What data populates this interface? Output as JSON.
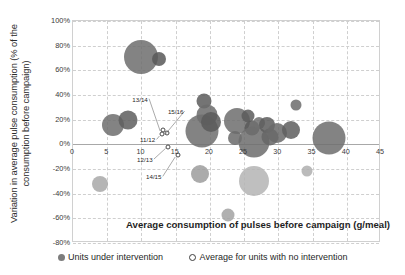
{
  "chart_data": {
    "type": "scatter",
    "title": "",
    "xlabel": "Average consumption of pulses before campaign (g/meal)",
    "ylabel": "Variation in average pulse consumption (% of the consumption before campaign)",
    "xlim": [
      0,
      45
    ],
    "ylim": [
      -80,
      100
    ],
    "xticks": [
      "0",
      "5",
      "10",
      "15",
      "20",
      "25",
      "30",
      "35",
      "40",
      "45"
    ],
    "xtick_values": [
      0,
      5,
      10,
      15,
      20,
      25,
      30,
      35,
      40,
      45
    ],
    "yticks": [
      "100%",
      "80%",
      "60%",
      "40%",
      "20%",
      "0%",
      "-20%",
      "-40%",
      "-60%",
      "-80%"
    ],
    "ytick_values": [
      100,
      80,
      60,
      40,
      20,
      0,
      -20,
      -40,
      -60,
      -80
    ],
    "grid": true,
    "legend_position": "bottom",
    "legend": [
      {
        "key": "intervention",
        "label": "Units under intervention",
        "marker": "filled-circle",
        "color": "#7d7d7d"
      },
      {
        "key": "no-intervention",
        "label": "Average for units with no intervention",
        "marker": "hollow-circle",
        "color": "#ffffff"
      }
    ],
    "series": [
      {
        "name": "Units under intervention",
        "marker": "bubble",
        "points": [
          {
            "x": 10.0,
            "y": 71,
            "size": 34,
            "color": "#6f6f6f"
          },
          {
            "x": 12.6,
            "y": 69,
            "size": 14,
            "color": "#5a5a5a"
          },
          {
            "x": 5.8,
            "y": 16,
            "size": 22,
            "color": "#6f6f6f"
          },
          {
            "x": 8.0,
            "y": 20,
            "size": 19,
            "color": "#5f5f5f"
          },
          {
            "x": 19.1,
            "y": 35,
            "size": 15,
            "color": "#5d5d5d"
          },
          {
            "x": 19.6,
            "y": 24,
            "size": 21,
            "color": "#6c6c6c"
          },
          {
            "x": 18.9,
            "y": 11,
            "size": 33,
            "color": "#6f6f6f"
          },
          {
            "x": 20.2,
            "y": 18,
            "size": 20,
            "color": "#5b5b5b"
          },
          {
            "x": 23.9,
            "y": 19,
            "size": 26,
            "color": "#6f6f6f"
          },
          {
            "x": 23.6,
            "y": 5,
            "size": 14,
            "color": "#6b6b6b"
          },
          {
            "x": 25.6,
            "y": 23,
            "size": 13,
            "color": "#5c5c5c"
          },
          {
            "x": 26.1,
            "y": 13,
            "size": 15,
            "color": "#5a5a5a"
          },
          {
            "x": 26.5,
            "y": 2,
            "size": 31,
            "color": "#6e6e6e"
          },
          {
            "x": 27.2,
            "y": 17,
            "size": 12,
            "color": "#707070"
          },
          {
            "x": 28.4,
            "y": 16,
            "size": 16,
            "color": "#5d5d5d"
          },
          {
            "x": 28.8,
            "y": 6,
            "size": 17,
            "color": "#666666"
          },
          {
            "x": 29.8,
            "y": 9,
            "size": 20,
            "color": "#6a6a6a"
          },
          {
            "x": 31.9,
            "y": 12,
            "size": 18,
            "color": "#5f5f5f"
          },
          {
            "x": 32.6,
            "y": 32,
            "size": 11,
            "color": "#6d6d6d"
          },
          {
            "x": 37.4,
            "y": 5,
            "size": 33,
            "color": "#6f6f6f"
          },
          {
            "x": 3.9,
            "y": -32,
            "size": 16,
            "color": "#a9a9a9"
          },
          {
            "x": 18.6,
            "y": -24,
            "size": 18,
            "color": "#9d9d9d"
          },
          {
            "x": 26.5,
            "y": -30,
            "size": 30,
            "color": "#b4b4b4"
          },
          {
            "x": 22.6,
            "y": -57,
            "size": 13,
            "color": "#a3a3a3"
          },
          {
            "x": 34.2,
            "y": -22,
            "size": 11,
            "color": "#b0b0b0"
          }
        ]
      },
      {
        "name": "Average for units with no intervention",
        "marker": "hollow-bubble",
        "points": [
          {
            "x": 13.1,
            "y": 12,
            "size": 5,
            "label": "13/14"
          },
          {
            "x": 13.8,
            "y": 9,
            "size": 5,
            "label": "15/16"
          },
          {
            "x": 13.0,
            "y": 8,
            "size": 5,
            "label": "11/12"
          },
          {
            "x": 13.9,
            "y": -2,
            "size": 5,
            "label": "12/13"
          },
          {
            "x": 15.3,
            "y": -9,
            "size": 5,
            "label": "14/15"
          }
        ]
      }
    ],
    "annotations": [
      {
        "text": "13/14",
        "x": 9.8,
        "y": 37
      },
      {
        "text": "15/16",
        "x": 15.0,
        "y": 27
      },
      {
        "text": "11/12",
        "x": 10.9,
        "y": 4
      },
      {
        "text": "12/13",
        "x": 10.5,
        "y": -12
      },
      {
        "text": "14/15",
        "x": 11.8,
        "y": -26
      }
    ]
  }
}
